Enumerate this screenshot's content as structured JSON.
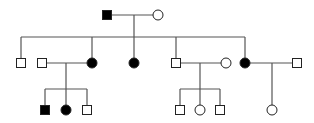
{
  "diagram": {
    "type": "pedigree",
    "colors": {
      "line": "#555555",
      "affected_fill": "#000000",
      "unaffected_fill": "#ffffff",
      "stroke": "#222222"
    },
    "symbol_size": 9,
    "individuals": [
      {
        "id": "I-1",
        "generation": 1,
        "sex": "male",
        "affected": true,
        "x": 107,
        "y": 15
      },
      {
        "id": "I-2",
        "generation": 1,
        "sex": "female",
        "affected": false,
        "x": 158,
        "y": 15
      },
      {
        "id": "II-1",
        "generation": 2,
        "sex": "male",
        "affected": false,
        "x": 21,
        "y": 63
      },
      {
        "id": "II-2",
        "generation": 2,
        "sex": "male",
        "affected": false,
        "x": 42,
        "y": 63,
        "spouse": true
      },
      {
        "id": "II-3",
        "generation": 2,
        "sex": "female",
        "affected": true,
        "x": 92,
        "y": 63
      },
      {
        "id": "II-4",
        "generation": 2,
        "sex": "female",
        "affected": true,
        "x": 134,
        "y": 63
      },
      {
        "id": "II-5",
        "generation": 2,
        "sex": "male",
        "affected": false,
        "x": 176,
        "y": 63
      },
      {
        "id": "II-6",
        "generation": 2,
        "sex": "female",
        "affected": false,
        "x": 226,
        "y": 63,
        "spouse": true
      },
      {
        "id": "II-7",
        "generation": 2,
        "sex": "female",
        "affected": true,
        "x": 245,
        "y": 63
      },
      {
        "id": "II-8",
        "generation": 2,
        "sex": "male",
        "affected": false,
        "x": 297,
        "y": 63,
        "spouse": true
      },
      {
        "id": "III-1",
        "generation": 3,
        "sex": "male",
        "affected": true,
        "x": 45,
        "y": 110
      },
      {
        "id": "III-2",
        "generation": 3,
        "sex": "female",
        "affected": true,
        "x": 66,
        "y": 110
      },
      {
        "id": "III-3",
        "generation": 3,
        "sex": "male",
        "affected": false,
        "x": 87,
        "y": 110
      },
      {
        "id": "III-4",
        "generation": 3,
        "sex": "male",
        "affected": false,
        "x": 180,
        "y": 110
      },
      {
        "id": "III-5",
        "generation": 3,
        "sex": "female",
        "affected": false,
        "x": 200,
        "y": 110
      },
      {
        "id": "III-6",
        "generation": 3,
        "sex": "male",
        "affected": false,
        "x": 220,
        "y": 110
      },
      {
        "id": "III-7",
        "generation": 3,
        "sex": "female",
        "affected": false,
        "x": 272,
        "y": 110
      }
    ],
    "lines": [
      {
        "name": "mating-line-I",
        "x1": 111,
        "y1": 15,
        "x2": 154,
        "y2": 15
      },
      {
        "name": "descent-line-I",
        "x1": 134,
        "y1": 15,
        "x2": 134,
        "y2": 37
      },
      {
        "name": "sibship-line-II",
        "x1": 21,
        "y1": 37,
        "x2": 245,
        "y2": 37
      },
      {
        "name": "drop-II-1",
        "x1": 21,
        "y1": 37,
        "x2": 21,
        "y2": 59
      },
      {
        "name": "drop-II-3",
        "x1": 92,
        "y1": 37,
        "x2": 92,
        "y2": 59
      },
      {
        "name": "drop-II-4",
        "x1": 134,
        "y1": 37,
        "x2": 134,
        "y2": 59
      },
      {
        "name": "drop-II-5",
        "x1": 176,
        "y1": 37,
        "x2": 176,
        "y2": 59
      },
      {
        "name": "drop-II-7",
        "x1": 245,
        "y1": 37,
        "x2": 245,
        "y2": 59
      },
      {
        "name": "mating-line-II-2-3",
        "x1": 46,
        "y1": 63,
        "x2": 88,
        "y2": 63
      },
      {
        "name": "descent-line-II-2-3",
        "x1": 66,
        "y1": 63,
        "x2": 66,
        "y2": 89
      },
      {
        "name": "sibship-line-III-a",
        "x1": 45,
        "y1": 89,
        "x2": 87,
        "y2": 89
      },
      {
        "name": "drop-III-1",
        "x1": 45,
        "y1": 89,
        "x2": 45,
        "y2": 106
      },
      {
        "name": "drop-III-2",
        "x1": 66,
        "y1": 89,
        "x2": 66,
        "y2": 106
      },
      {
        "name": "drop-III-3",
        "x1": 87,
        "y1": 89,
        "x2": 87,
        "y2": 106
      },
      {
        "name": "mating-line-II-5-6",
        "x1": 180,
        "y1": 63,
        "x2": 222,
        "y2": 63
      },
      {
        "name": "descent-line-II-5-6",
        "x1": 200,
        "y1": 63,
        "x2": 200,
        "y2": 89
      },
      {
        "name": "sibship-line-III-b",
        "x1": 180,
        "y1": 89,
        "x2": 220,
        "y2": 89
      },
      {
        "name": "drop-III-4",
        "x1": 180,
        "y1": 89,
        "x2": 180,
        "y2": 106
      },
      {
        "name": "drop-III-5",
        "x1": 200,
        "y1": 89,
        "x2": 200,
        "y2": 106
      },
      {
        "name": "drop-III-6",
        "x1": 220,
        "y1": 89,
        "x2": 220,
        "y2": 106
      },
      {
        "name": "mating-line-II-7-8",
        "x1": 249,
        "y1": 63,
        "x2": 293,
        "y2": 63
      },
      {
        "name": "descent-line-II-7-8",
        "x1": 272,
        "y1": 63,
        "x2": 272,
        "y2": 106
      }
    ]
  }
}
